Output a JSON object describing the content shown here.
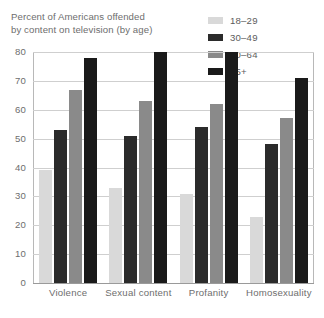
{
  "chart_data": {
    "type": "bar",
    "title": "Percent of Americans offended by content on television (by age)",
    "title_line1": "Percent of Americans offended",
    "title_line2": "by content on television (by age)",
    "xlabel": "",
    "ylabel": "",
    "ylim": [
      0,
      80
    ],
    "ytick_labels": [
      "80",
      "70",
      "60",
      "50",
      "40",
      "30",
      "20",
      "10",
      "0"
    ],
    "ytick_values": [
      80,
      70,
      60,
      50,
      40,
      30,
      20,
      10,
      0
    ],
    "grid": true,
    "legend_position": "top-right",
    "categories": [
      "Violence",
      "Sexual content",
      "Profanity",
      "Homosexuality"
    ],
    "series": [
      {
        "name": "18–29",
        "color": "#d9d9d9",
        "values": [
          39,
          33,
          31,
          23
        ]
      },
      {
        "name": "30–49",
        "color": "#2b2b2b",
        "values": [
          53,
          51,
          54,
          48
        ]
      },
      {
        "name": "50–64",
        "color": "#8a8a8a",
        "values": [
          67,
          63,
          62,
          57
        ]
      },
      {
        "name": "65+",
        "color": "#1a1a1a",
        "values": [
          78,
          80,
          80,
          71
        ]
      }
    ]
  },
  "colors": {
    "background": "#ffffff",
    "gridline": "#cfcfcf",
    "axis": "#9a9a9a",
    "plot_border": "#b8b8b8",
    "text": "#6e6e6e"
  }
}
